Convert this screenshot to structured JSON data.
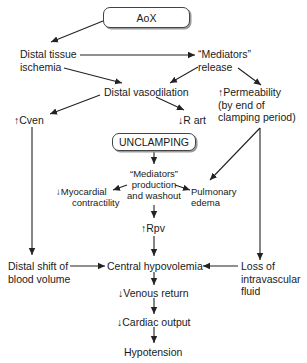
{
  "diagram": {
    "title_box": "AoX",
    "unclamping_box": "UNCLAMPING",
    "nodes": {
      "distal_tissue_ischemia": [
        "Distal tissue",
        "ischemia"
      ],
      "mediators_release": [
        "“Mediators”",
        "release"
      ],
      "distal_vasodilation": "Distal vasodilation",
      "permeability": [
        "↑Permeability",
        "(by end of",
        "clamping period)"
      ],
      "cven": "↑Cven",
      "r_art": "↓R art",
      "mediators_production": [
        "“Mediators”",
        "production",
        "and washout"
      ],
      "myocardial_contractility": [
        "↓Myocardial",
        "contractility"
      ],
      "pulmonary_edema": [
        "Pulmonary",
        "edema"
      ],
      "rpv": "↑Rpv",
      "distal_shift": [
        "Distal shift of",
        "blood volume"
      ],
      "central_hypovolemia": "Central hypovolemia",
      "loss_fluid": [
        "Loss of",
        "intravascular",
        "fluid"
      ],
      "venous_return": "↓Venous return",
      "cardiac_output": "↓Cardiac output",
      "hypotension": "Hypotension"
    },
    "edges": [
      {
        "from": "AoX",
        "to": "Distal tissue ischemia"
      },
      {
        "from": "Distal tissue ischemia",
        "to": "Mediators release"
      },
      {
        "from": "Distal tissue ischemia",
        "to": "Distal vasodilation"
      },
      {
        "from": "Mediators release",
        "to": "Distal vasodilation"
      },
      {
        "from": "Mediators release",
        "to": "Permeability"
      },
      {
        "from": "Distal vasodilation",
        "to": "Cven"
      },
      {
        "from": "Distal vasodilation",
        "to": "R art"
      },
      {
        "from": "Permeability",
        "to": "Pulmonary edema"
      },
      {
        "from": "Permeability",
        "to": "Loss of intravascular fluid"
      },
      {
        "from": "UNCLAMPING",
        "to": "Mediators production and washout"
      },
      {
        "from": "Mediators production and washout",
        "to": "Myocardial contractility"
      },
      {
        "from": "Mediators production and washout",
        "to": "Pulmonary edema"
      },
      {
        "from": "Mediators production and washout",
        "to": "Rpv"
      },
      {
        "from": "Rpv",
        "to": "Central hypovolemia"
      },
      {
        "from": "Cven",
        "to": "Distal shift of blood volume"
      },
      {
        "from": "Distal shift of blood volume",
        "to": "Central hypovolemia"
      },
      {
        "from": "Loss of intravascular fluid",
        "to": "Central hypovolemia"
      },
      {
        "from": "Central hypovolemia",
        "to": "Venous return"
      },
      {
        "from": "Venous return",
        "to": "Cardiac output"
      },
      {
        "from": "Cardiac output",
        "to": "Hypotension"
      }
    ],
    "colors": {
      "line": "#222222",
      "text": "#1a1a1a",
      "box_border": "#444444",
      "shadow": "#9a9a9a"
    }
  }
}
